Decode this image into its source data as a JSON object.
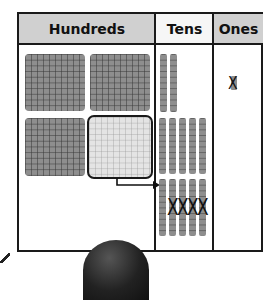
{
  "chart": {
    "headers": {
      "hundreds": "Hundreds",
      "tens": "Tens",
      "ones": "Ones"
    },
    "colors": {
      "header_gray": "#d0d0d0",
      "header_white": "#f6f6f6",
      "block_fill": "#8e8e8e",
      "regrouped_flat_fill": "#e4e4e4",
      "border": "#1a1a1a"
    },
    "hundreds": {
      "flats": 4,
      "regrouped_flat_index": 4,
      "arrow_label": ""
    },
    "tens": {
      "rows": [
        {
          "rods": 2,
          "crossed_out": 0
        },
        {
          "rods": 5,
          "crossed_out": 0
        },
        {
          "rods": 5,
          "crossed_out": 4
        }
      ]
    },
    "ones": {
      "cubes": 1,
      "crossed_out": 1
    },
    "marks": {
      "x": "X"
    }
  }
}
